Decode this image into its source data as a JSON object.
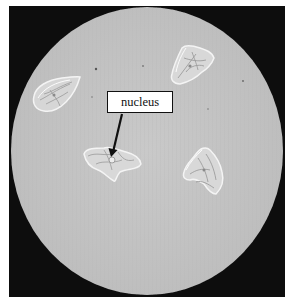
{
  "figure": {
    "label": {
      "text": "nucleus",
      "points_to": "nucleus of the lower-left cell"
    },
    "colors": {
      "frame": "#0d0d0d",
      "field": "#c4c4c4",
      "cell_fill": "#dcdcdc",
      "cell_edge": "#f2f2f2",
      "arrow": "#111111",
      "label_bg": "#ffffff"
    },
    "cells": [
      {
        "name": "upper-left-cell",
        "cx": 55,
        "cy": 95
      },
      {
        "name": "upper-right-cell",
        "cx": 192,
        "cy": 64
      },
      {
        "name": "center-left-cell",
        "cx": 112,
        "cy": 161
      },
      {
        "name": "right-cell",
        "cx": 203,
        "cy": 170
      }
    ]
  }
}
